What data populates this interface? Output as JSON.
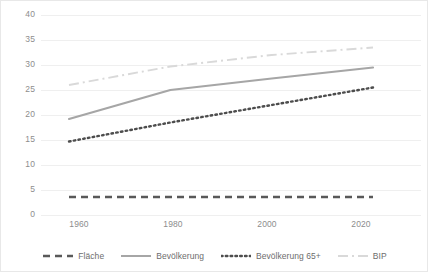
{
  "chart_data": {
    "type": "line",
    "title": "",
    "xlabel": "",
    "ylabel": "",
    "x": [
      1960,
      1980,
      2000,
      2020
    ],
    "xlim": [
      1956,
      1962
    ],
    "ylim": [
      0,
      40
    ],
    "yticks": [
      0,
      5,
      10,
      15,
      20,
      25,
      30,
      35,
      40
    ],
    "xticks": [
      1960,
      1980,
      2000,
      2020
    ],
    "grid": "horizontal",
    "legend_position": "bottom",
    "series": [
      {
        "name": "Fläche",
        "style": "dashed",
        "color": "#595959",
        "values": [
          3.6,
          3.6,
          3.6,
          3.6
        ]
      },
      {
        "name": "Bevölkerung",
        "style": "solid",
        "color": "#a6a6a6",
        "values": [
          19.2,
          25.0,
          27.3,
          29.5
        ]
      },
      {
        "name": "Bevölkerung 65+",
        "style": "dotted",
        "color": "#4d4d4d",
        "values": [
          14.7,
          18.5,
          22.0,
          25.5
        ]
      },
      {
        "name": "BIP",
        "style": "dashdot",
        "color": "#d9d9d9",
        "values": [
          26.0,
          29.7,
          32.0,
          33.5
        ]
      }
    ]
  },
  "axis": {
    "y_labels": [
      "40",
      "35",
      "30",
      "25",
      "20",
      "15",
      "10",
      "5",
      "0"
    ],
    "x_labels": [
      "1960",
      "1980",
      "2000",
      "2020"
    ]
  },
  "legend": {
    "items": [
      {
        "label": "Fläche"
      },
      {
        "label": "Bevölkerung"
      },
      {
        "label": "Bevölkerung 65+"
      },
      {
        "label": "BIP"
      }
    ]
  },
  "colors": {
    "gridline": "#efefef",
    "border": "#e8e8e8",
    "tick_text": "#8d8d8d",
    "legend_text": "#6d6d6d",
    "background": "#ffffff"
  }
}
